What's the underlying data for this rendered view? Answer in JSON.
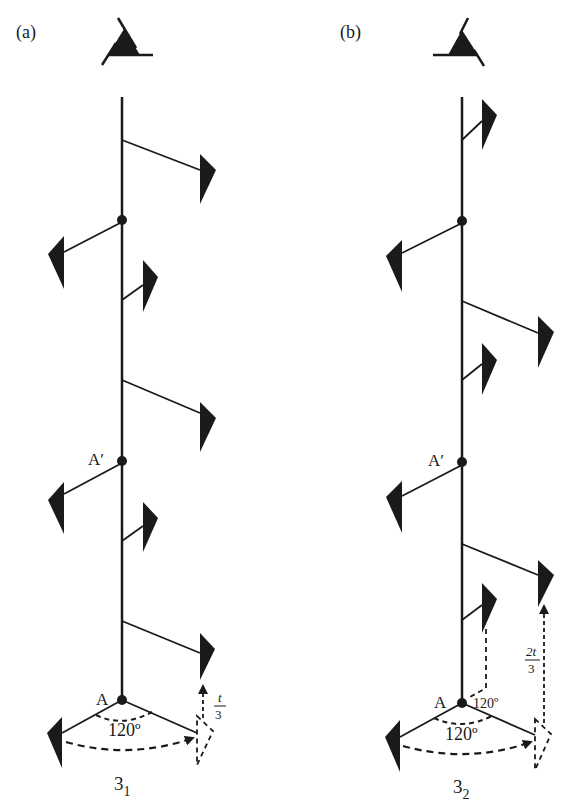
{
  "panels": [
    {
      "id": "a",
      "label": "(a)",
      "axis_point_top": "A′",
      "axis_point_bottom": "A",
      "angle_small": "120º",
      "angle_label": "120º",
      "translation_num": "t",
      "translation_den": "3",
      "caption_main": "3",
      "caption_sub": "1"
    },
    {
      "id": "b",
      "label": "(b)",
      "axis_point_top": "A′",
      "axis_point_bottom": "A",
      "angle_small": "120º",
      "angle_label": "120º",
      "translation_num": "2t",
      "translation_den": "3",
      "caption_main": "3",
      "caption_sub": "2"
    }
  ],
  "colors": {
    "ink": "#1a1a1a",
    "background": "#ffffff"
  }
}
